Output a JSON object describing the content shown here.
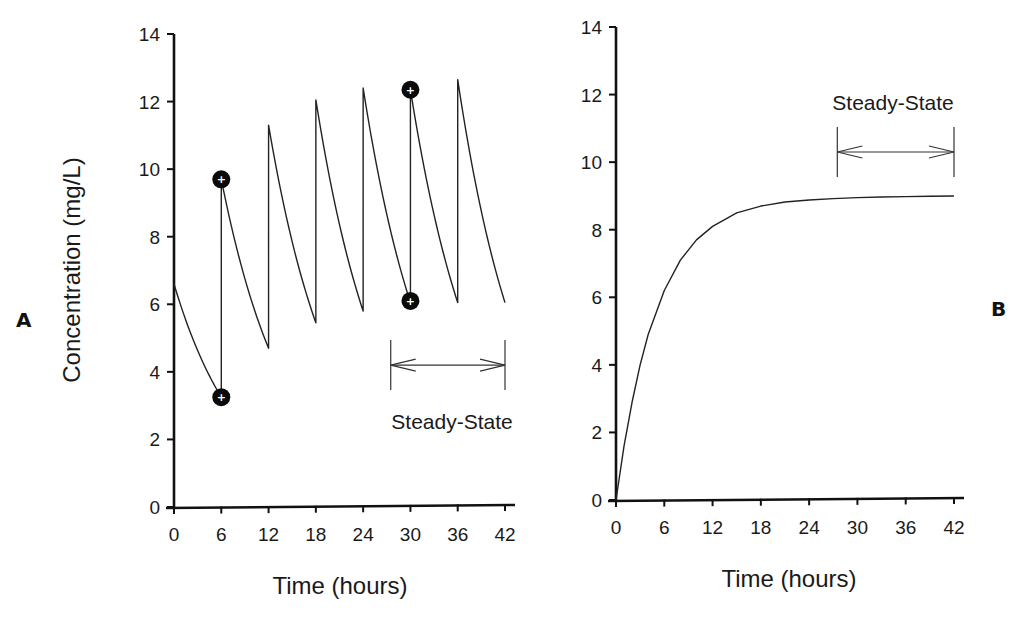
{
  "chart_data": [
    {
      "id": "A",
      "type": "line",
      "panel_label": "A",
      "title": "",
      "xlabel": "Time  (hours)",
      "ylabel": "Concentration  (mg/L)",
      "xlim": [
        0,
        42
      ],
      "ylim": [
        0,
        14
      ],
      "xticks": [
        0,
        6,
        12,
        18,
        24,
        30,
        36,
        42
      ],
      "yticks": [
        0,
        2,
        4,
        6,
        8,
        10,
        12,
        14
      ],
      "grid": false,
      "dosing_interval_hours": 6,
      "series": [
        {
          "name": "Intermittent dosing concentration",
          "segments": [
            {
              "t_start": 0,
              "c_start": 6.6,
              "t_end": 6,
              "c_end": 3.25
            },
            {
              "t_start": 6,
              "c_start": 9.7,
              "t_end": 12,
              "c_end": 4.7
            },
            {
              "t_start": 12,
              "c_start": 11.3,
              "t_end": 18,
              "c_end": 5.45
            },
            {
              "t_start": 18,
              "c_start": 12.05,
              "t_end": 24,
              "c_end": 5.8
            },
            {
              "t_start": 24,
              "c_start": 12.4,
              "t_end": 30,
              "c_end": 6.05
            },
            {
              "t_start": 30,
              "c_start": 12.35,
              "t_end": 36,
              "c_end": 6.05
            },
            {
              "t_start": 36,
              "c_start": 12.65,
              "t_end": 42,
              "c_end": 6.05
            }
          ]
        }
      ],
      "markers": [
        {
          "t": 6,
          "c": 9.7,
          "label": "+"
        },
        {
          "t": 6,
          "c": 3.25,
          "label": "+"
        },
        {
          "t": 30,
          "c": 12.35,
          "label": "+"
        },
        {
          "t": 30,
          "c": 6.1,
          "label": "+"
        }
      ],
      "annotations": [
        {
          "text": "Steady-State",
          "type": "range-arrow",
          "x_from": 27.5,
          "x_to": 42,
          "y": 4.2
        }
      ]
    },
    {
      "id": "B",
      "type": "line",
      "panel_label": "B",
      "title": "",
      "xlabel": "Time  (hours)",
      "ylabel": "",
      "xlim": [
        0,
        42
      ],
      "ylim": [
        0,
        14
      ],
      "xticks": [
        0,
        6,
        12,
        18,
        24,
        30,
        36,
        42
      ],
      "yticks": [
        0,
        2,
        4,
        6,
        8,
        10,
        12,
        14
      ],
      "grid": false,
      "series": [
        {
          "name": "Continuous infusion concentration",
          "x": [
            0,
            1,
            2,
            3,
            4,
            6,
            8,
            10,
            12,
            15,
            18,
            21,
            24,
            27,
            30,
            33,
            36,
            39,
            42
          ],
          "y": [
            0,
            1.6,
            2.9,
            4.0,
            4.9,
            6.2,
            7.1,
            7.7,
            8.1,
            8.5,
            8.7,
            8.82,
            8.88,
            8.92,
            8.95,
            8.97,
            8.98,
            8.99,
            9.0
          ]
        }
      ],
      "annotations": [
        {
          "text": "Steady-State",
          "type": "range-arrow",
          "x_from": 27.5,
          "x_to": 42,
          "y": 10.3
        }
      ]
    }
  ]
}
